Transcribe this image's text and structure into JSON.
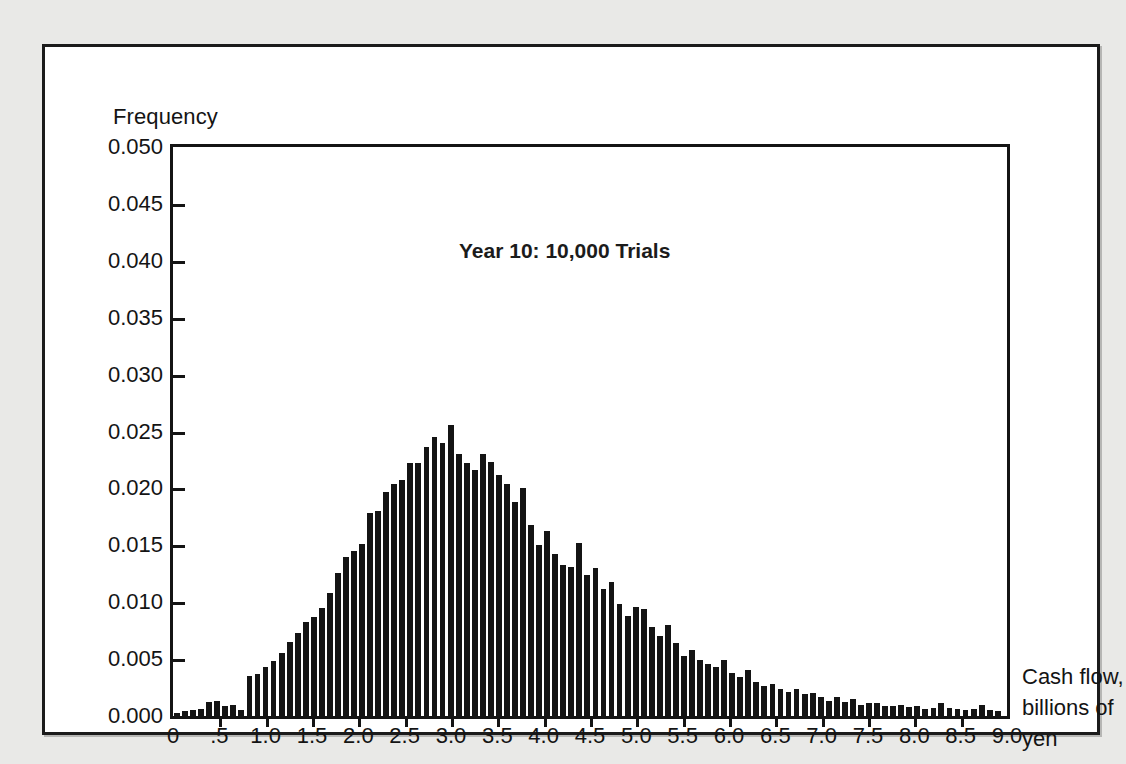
{
  "figure": {
    "annotation": "Year 10: 10,000 Trials",
    "y_axis_title": "Frequency",
    "x_axis_title_lines": [
      "Cash flow,",
      "billions of",
      "yen"
    ],
    "colors": {
      "bar": "#141414",
      "axis": "#141414",
      "page_background": "#e9e9e7",
      "panel_background": "#ffffff"
    }
  },
  "chart_data": {
    "type": "bar",
    "title": "Year 10: 10,000 Trials",
    "xlabel": "Cash flow, billions of yen",
    "ylabel": "Frequency",
    "xlim": [
      0,
      9.0
    ],
    "ylim": [
      0,
      0.05
    ],
    "grid": false,
    "legend": false,
    "y_ticks": [
      0.0,
      0.005,
      0.01,
      0.015,
      0.02,
      0.025,
      0.03,
      0.035,
      0.04,
      0.045,
      0.05
    ],
    "y_tick_labels": [
      "0.000",
      "0.005",
      "0.010",
      "0.015",
      "0.020",
      "0.025",
      "0.030",
      "0.035",
      "0.040",
      "0.045",
      "0.050"
    ],
    "x_ticks": [
      0,
      0.5,
      1.0,
      1.5,
      2.0,
      2.5,
      3.0,
      3.5,
      4.0,
      4.5,
      5.0,
      5.5,
      6.0,
      6.5,
      7.0,
      7.5,
      8.0,
      8.5,
      9.0
    ],
    "x_tick_labels": [
      "0",
      ".5",
      "1.0",
      "1.5",
      "2.0",
      "2.5",
      "3.0",
      "3.5",
      "4.0",
      "4.5",
      "5.0",
      "5.5",
      "6.0",
      "6.5",
      "7.0",
      "7.5",
      "8.0",
      "8.5",
      "9.0"
    ],
    "bin_width": 0.0868,
    "x": [
      0.043,
      0.13,
      0.217,
      0.304,
      0.391,
      0.477,
      0.564,
      0.651,
      0.738,
      0.825,
      0.912,
      0.998,
      1.085,
      1.172,
      1.259,
      1.346,
      1.433,
      1.519,
      1.606,
      1.693,
      1.78,
      1.867,
      1.954,
      2.04,
      2.127,
      2.214,
      2.301,
      2.388,
      2.475,
      2.561,
      2.648,
      2.735,
      2.822,
      2.909,
      2.996,
      3.082,
      3.169,
      3.256,
      3.343,
      3.43,
      3.517,
      3.603,
      3.69,
      3.777,
      3.864,
      3.951,
      4.038,
      4.124,
      4.211,
      4.298,
      4.385,
      4.472,
      4.559,
      4.645,
      4.732,
      4.819,
      4.906,
      4.993,
      5.08,
      5.166,
      5.253,
      5.34,
      5.427,
      5.514,
      5.601,
      5.687,
      5.774,
      5.861,
      5.948,
      6.035,
      6.122,
      6.208,
      6.295,
      6.382,
      6.469,
      6.556,
      6.643,
      6.729,
      6.816,
      6.903,
      6.99,
      7.077,
      7.164,
      7.25,
      7.337,
      7.424,
      7.511,
      7.598,
      7.685,
      7.771,
      7.858,
      7.945,
      8.032,
      8.119,
      8.206,
      8.292,
      8.379,
      8.466,
      8.553,
      8.64,
      8.727,
      8.813,
      8.9
    ],
    "values": [
      0.0003,
      0.0004,
      0.0005,
      0.0006,
      0.0012,
      0.0013,
      0.0009,
      0.001,
      0.0005,
      0.0035,
      0.0037,
      0.0043,
      0.0048,
      0.0055,
      0.0065,
      0.0073,
      0.0083,
      0.0087,
      0.0095,
      0.0108,
      0.0126,
      0.014,
      0.0145,
      0.0151,
      0.0178,
      0.018,
      0.0197,
      0.0204,
      0.0207,
      0.0222,
      0.0222,
      0.0236,
      0.0245,
      0.024,
      0.0256,
      0.023,
      0.0222,
      0.0216,
      0.023,
      0.0223,
      0.0212,
      0.0204,
      0.0188,
      0.02,
      0.0168,
      0.015,
      0.0163,
      0.0142,
      0.0133,
      0.0131,
      0.0152,
      0.0124,
      0.013,
      0.0112,
      0.0118,
      0.0098,
      0.0088,
      0.0096,
      0.0094,
      0.0078,
      0.007,
      0.008,
      0.0064,
      0.0053,
      0.0058,
      0.0049,
      0.0046,
      0.0043,
      0.0049,
      0.0038,
      0.0034,
      0.004,
      0.003,
      0.0026,
      0.0028,
      0.0024,
      0.0021,
      0.0024,
      0.0019,
      0.002,
      0.0017,
      0.0013,
      0.0017,
      0.0012,
      0.0015,
      0.001,
      0.0011,
      0.0011,
      0.0009,
      0.0009,
      0.001,
      0.0008,
      0.0009,
      0.0006,
      0.0007,
      0.0011,
      0.0007,
      0.0006,
      0.0005,
      0.0006,
      0.001,
      0.0005,
      0.0004
    ]
  }
}
